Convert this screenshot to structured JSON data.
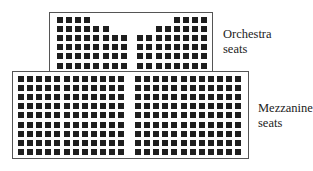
{
  "labels": {
    "orchestra_line1": "Orchestra",
    "orchestra_line2": "seats",
    "mezzanine_line1": "Mezzanine",
    "mezzanine_line2": "seats"
  },
  "orchestra": {
    "rows": 6,
    "left_counts": [
      4,
      6,
      8,
      8,
      8,
      8
    ],
    "right_counts": [
      4,
      6,
      8,
      8,
      8,
      8
    ],
    "total": 84
  },
  "mezzanine": {
    "rows": 9,
    "left_columns": 12,
    "right_columns": 12,
    "total": 216
  },
  "colors": {
    "seat": "#1e1e1e",
    "border": "#555555"
  }
}
